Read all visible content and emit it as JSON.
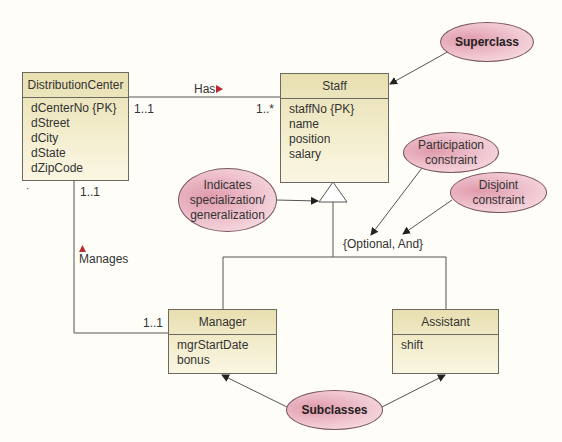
{
  "classes": {
    "distribution_center": {
      "name": "DistributionCenter",
      "attributes": [
        "dCenterNo {PK}",
        "dStreet",
        "dCity",
        "dState",
        "dZipCode"
      ]
    },
    "staff": {
      "name": "Staff",
      "attributes": [
        "staffNo {PK}",
        "name",
        "position",
        "salary"
      ]
    },
    "manager": {
      "name": "Manager",
      "attributes": [
        "mgrStartDate",
        "bonus"
      ]
    },
    "assistant": {
      "name": "Assistant",
      "attributes": [
        "shift"
      ]
    }
  },
  "associations": {
    "has": {
      "label": "Has",
      "left_mult": "1..1",
      "right_mult": "1..*"
    },
    "manages": {
      "label": "Manages",
      "top_mult": "1..1",
      "bottom_mult": "1..1"
    }
  },
  "constraint_label": "{Optional, And}",
  "annotations": {
    "superclass": "Superclass",
    "participation": [
      "Participation",
      "constraint"
    ],
    "disjoint": [
      "Disjoint",
      "constraint"
    ],
    "indicates": [
      "Indicates",
      "specialization/",
      "generalization"
    ],
    "subclasses": "Subclasses"
  },
  "colors": {
    "class_fill": "#f2ecc8",
    "annotation_fill": "#eab4c2",
    "association_arrow": "#c0272d",
    "line": "#555555"
  }
}
